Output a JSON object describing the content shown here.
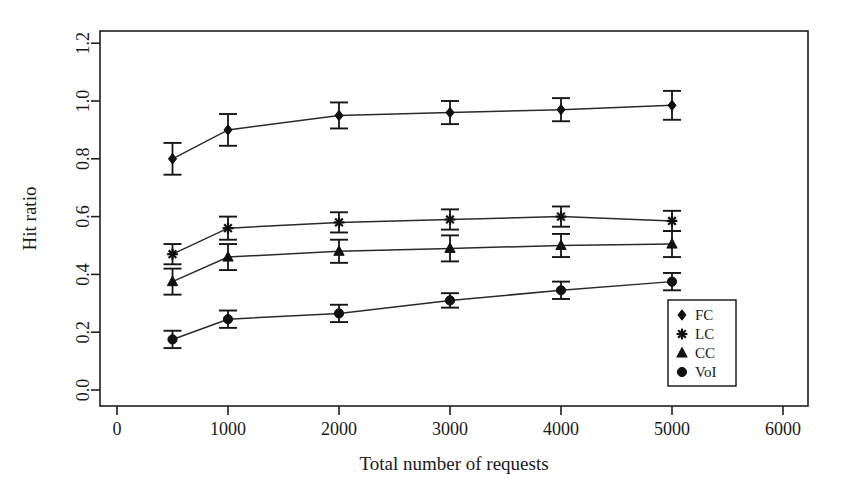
{
  "chart_data": {
    "type": "line",
    "title": "",
    "xlabel": "Total number of requests",
    "ylabel": "Hit ratio",
    "xlim": [
      0,
      6300
    ],
    "ylim": [
      0.0,
      1.26
    ],
    "xticks": [
      0,
      1000,
      2000,
      3000,
      4000,
      5000,
      6000
    ],
    "xtick_labels": [
      "0",
      "1000",
      "2000",
      "3000",
      "4000",
      "5000",
      "6000"
    ],
    "yticks": [
      0.0,
      0.2,
      0.4,
      0.6,
      0.8,
      1.0,
      1.2
    ],
    "ytick_labels": [
      "0.0",
      "0.2",
      "0.4",
      "0.6",
      "0.8",
      "1.0",
      "1.2"
    ],
    "grid": false,
    "legend_position": "bottom-right",
    "x": [
      500,
      1000,
      2000,
      3000,
      4000,
      5000
    ],
    "series": [
      {
        "name": "FC",
        "marker": "filled-diamond",
        "values": [
          0.8,
          0.9,
          0.95,
          0.96,
          0.97,
          0.985
        ],
        "errors": [
          0.055,
          0.055,
          0.045,
          0.04,
          0.04,
          0.05
        ]
      },
      {
        "name": "LC",
        "marker": "star",
        "values": [
          0.47,
          0.56,
          0.58,
          0.59,
          0.6,
          0.585
        ],
        "errors": [
          0.035,
          0.04,
          0.035,
          0.035,
          0.035,
          0.035
        ]
      },
      {
        "name": "CC",
        "marker": "open-triangle",
        "values": [
          0.375,
          0.46,
          0.48,
          0.49,
          0.5,
          0.505
        ],
        "errors": [
          0.045,
          0.045,
          0.04,
          0.045,
          0.04,
          0.045
        ]
      },
      {
        "name": "VoI",
        "marker": "open-circle",
        "values": [
          0.175,
          0.245,
          0.265,
          0.31,
          0.345,
          0.375
        ],
        "errors": [
          0.03,
          0.03,
          0.03,
          0.025,
          0.03,
          0.03
        ]
      }
    ]
  },
  "legend": {
    "entries": [
      {
        "label": "FC",
        "marker": "filled-diamond"
      },
      {
        "label": "LC",
        "marker": "star"
      },
      {
        "label": "CC",
        "marker": "open-triangle"
      },
      {
        "label": "VoI",
        "marker": "open-circle"
      }
    ]
  },
  "colors": {
    "ink": "#111111",
    "frame": "#1f1f1f",
    "background": "#ffffff"
  }
}
